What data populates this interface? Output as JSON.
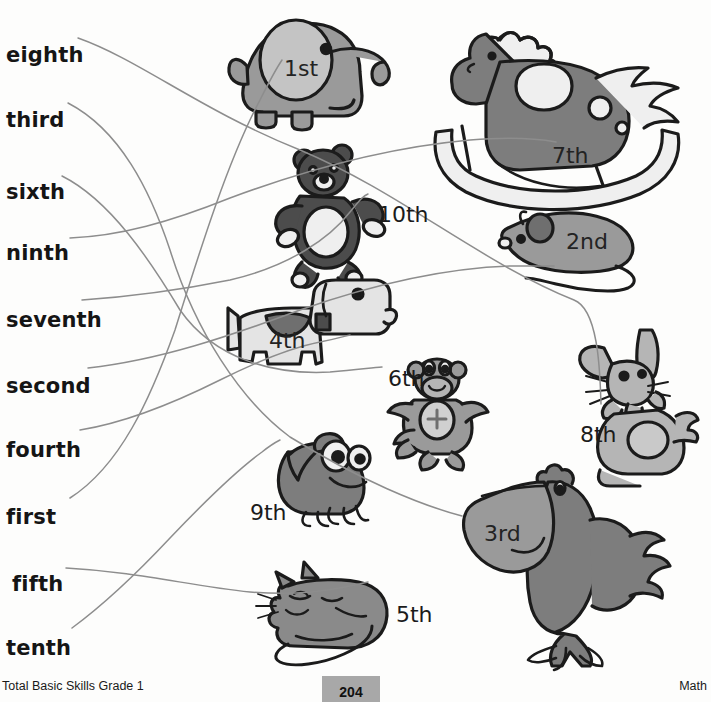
{
  "worksheet": {
    "subject": "Math",
    "book": "Total Basic Skills Grade 1",
    "page_number": "204"
  },
  "word_list": {
    "label": "ordinal-words",
    "items": [
      {
        "text": "eighth",
        "x": 6,
        "y": 43
      },
      {
        "text": "third",
        "x": 6,
        "y": 108
      },
      {
        "text": "sixth",
        "x": 6,
        "y": 180
      },
      {
        "text": "ninth",
        "x": 6,
        "y": 241
      },
      {
        "text": "seventh",
        "x": 6,
        "y": 308
      },
      {
        "text": "second",
        "x": 6,
        "y": 374
      },
      {
        "text": "fourth",
        "x": 6,
        "y": 438
      },
      {
        "text": "first",
        "x": 6,
        "y": 505
      },
      {
        "text": "fifth",
        "x": 12,
        "y": 572
      },
      {
        "text": "tenth",
        "x": 6,
        "y": 636
      }
    ]
  },
  "toys": [
    {
      "name": "elephant",
      "ordinal": "1st",
      "label_x": 284,
      "label_y": 56,
      "on_art": true
    },
    {
      "name": "rocking-horse",
      "ordinal": "7th",
      "label_x": 552,
      "label_y": 143,
      "on_art": true
    },
    {
      "name": "teddy-bear",
      "ordinal": "10th",
      "label_x": 378,
      "label_y": 202,
      "on_art": false
    },
    {
      "name": "mouse",
      "ordinal": "2nd",
      "label_x": 566,
      "label_y": 229,
      "on_art": true
    },
    {
      "name": "dog",
      "ordinal": "4th",
      "label_x": 269,
      "label_y": 328,
      "on_art": true
    },
    {
      "name": "monkey",
      "ordinal": "6th",
      "label_x": 388,
      "label_y": 366,
      "on_art": false
    },
    {
      "name": "rabbit",
      "ordinal": "8th",
      "label_x": 580,
      "label_y": 422,
      "on_art": false
    },
    {
      "name": "frog",
      "ordinal": "9th",
      "label_x": 250,
      "label_y": 500,
      "on_art": false
    },
    {
      "name": "pelican",
      "ordinal": "3rd",
      "label_x": 484,
      "label_y": 521,
      "on_art": true
    },
    {
      "name": "cat",
      "ordinal": "5th",
      "label_x": 396,
      "label_y": 602,
      "on_art": false
    }
  ],
  "connections": [
    {
      "from": "eighth",
      "to": "rabbit",
      "path": "M 78 38 C 140 60 200 110 300 150 C 400 192 480 262 574 300 C 600 310 600 380 601 404"
    },
    {
      "from": "third",
      "to": "pelican",
      "path": "M 68 103 C 120 130 150 190 170 250 C 195 330 240 400 290 437 C 360 480 420 505 462 516"
    },
    {
      "from": "sixth",
      "to": "monkey",
      "path": "M 62 176 C 110 200 150 260 180 310 C 215 360 275 375 330 372 C 355 370 370 368 382 367"
    },
    {
      "from": "ninth",
      "to": "horse-rocker",
      "path": "M 70 238 C 120 236 170 222 230 198 C 300 172 380 148 470 140 C 520 136 545 140 556 142"
    },
    {
      "from": "seventh",
      "to": "bear",
      "path": "M 82 300 C 140 296 180 290 230 280 C 290 266 330 238 350 212 C 360 200 363 196 368 194"
    },
    {
      "from": "second",
      "to": "mouse-tail",
      "path": "M 88 368 C 160 360 230 336 300 310 C 380 282 450 268 510 266 C 540 266 548 266 554 266"
    },
    {
      "from": "fourth",
      "to": "dog",
      "path": "M 80 430 C 130 422 180 400 220 380 C 260 360 290 348 320 342 C 340 338 345 336 350 335"
    },
    {
      "from": "first",
      "to": "elephant",
      "path": "M 70 498 C 120 466 150 400 175 330 C 200 250 228 160 260 100 C 272 76 278 66 282 60"
    },
    {
      "from": "fifth",
      "to": "cat",
      "path": "M 66 568 C 140 572 190 586 250 592 C 300 596 330 590 350 586 C 360 584 364 583 368 582"
    },
    {
      "from": "tenth",
      "to": "frog",
      "path": "M 72 628 C 110 600 140 570 170 538 C 210 496 240 468 262 452 C 272 444 276 442 280 440"
    }
  ],
  "colors": {
    "ink": "#1b1b1b",
    "line": "#8d8d8d",
    "mid_gray": "#919191",
    "light_gray": "#c9c9c9",
    "dark_gray": "#575757",
    "page_box": "#a8a8a8"
  }
}
